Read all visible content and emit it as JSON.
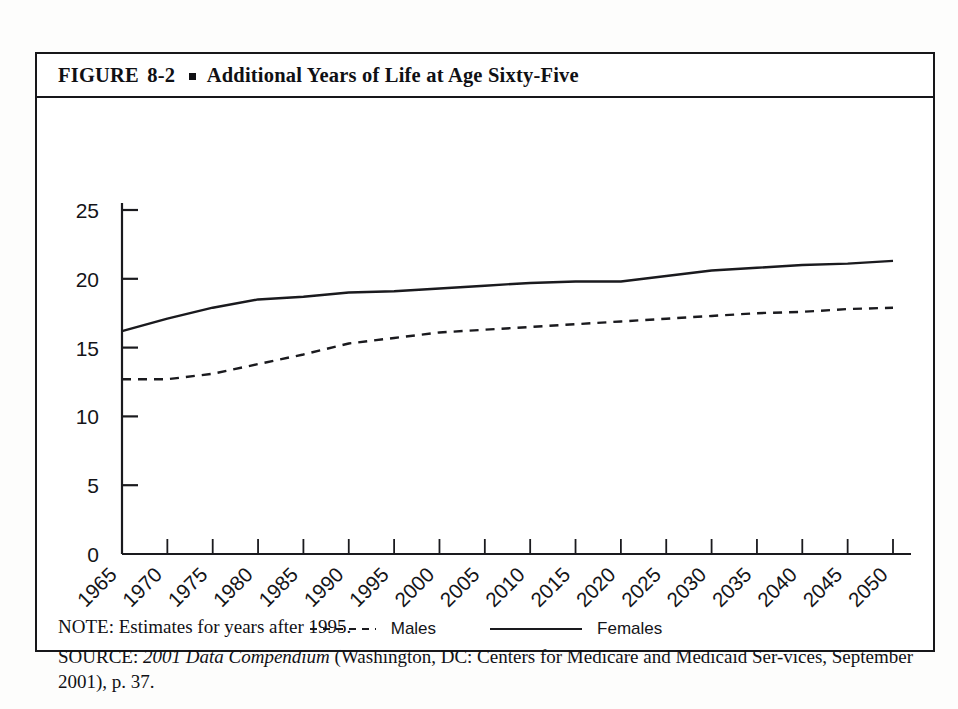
{
  "figure": {
    "label": "FIGURE",
    "number": "8-2",
    "bullet_icon": "square-bullet-icon",
    "title": "Additional Years of Life at Age Sixty-Five"
  },
  "notes": {
    "note_prefix": "NOTE:",
    "note_text": "Estimates for years after 1995.",
    "note_full": "NOTE: Estimates for years after 1995.",
    "source_prefix": "SOURCE:",
    "source_italic": "2001 Data Compendium",
    "source_rest": "(Washington, DC: Centers for Medicare and Medicaid Ser-vices, September 2001), p. 37.",
    "source_full": "SOURCE: 2001 Data Compendium (Washington, DC: Centers for Medicare and Medicaid Services, September 2001), p. 37."
  },
  "colors": {
    "ink": "#17171a",
    "page": "#ffffff",
    "line": "#1a1a1e"
  },
  "chart_data": {
    "type": "line",
    "title": "Additional Years of Life at Age Sixty-Five",
    "xlabel": "",
    "ylabel": "",
    "ylim": [
      0,
      25
    ],
    "yticks": [
      0,
      5,
      10,
      15,
      20,
      25
    ],
    "ytick_labels": [
      "0",
      "5",
      "10",
      "15",
      "20",
      "25"
    ],
    "grid": false,
    "legend_position": "bottom-center",
    "x": [
      1965,
      1970,
      1975,
      1980,
      1985,
      1990,
      1995,
      2000,
      2005,
      2010,
      2015,
      2020,
      2025,
      2030,
      2035,
      2040,
      2045,
      2050
    ],
    "categories": [
      "1965",
      "1970",
      "1975",
      "1980",
      "1985",
      "1990",
      "1995",
      "2000",
      "2005",
      "2010",
      "2015",
      "2020",
      "2025",
      "2030",
      "2035",
      "2040",
      "2045",
      "2050"
    ],
    "series": [
      {
        "name": "Males",
        "style": "dashed",
        "values": [
          12.7,
          12.7,
          13.1,
          13.8,
          14.5,
          15.3,
          15.7,
          16.1,
          16.3,
          16.5,
          16.7,
          16.9,
          17.1,
          17.3,
          17.5,
          17.6,
          17.8,
          17.9
        ]
      },
      {
        "name": "Females",
        "style": "solid",
        "values": [
          16.2,
          17.1,
          17.9,
          18.5,
          18.7,
          19.0,
          19.1,
          19.3,
          19.5,
          19.7,
          19.8,
          19.8,
          20.2,
          20.6,
          20.8,
          21.0,
          21.1,
          21.3
        ]
      }
    ]
  },
  "legend": {
    "males_label": "Males",
    "females_label": "Females"
  }
}
